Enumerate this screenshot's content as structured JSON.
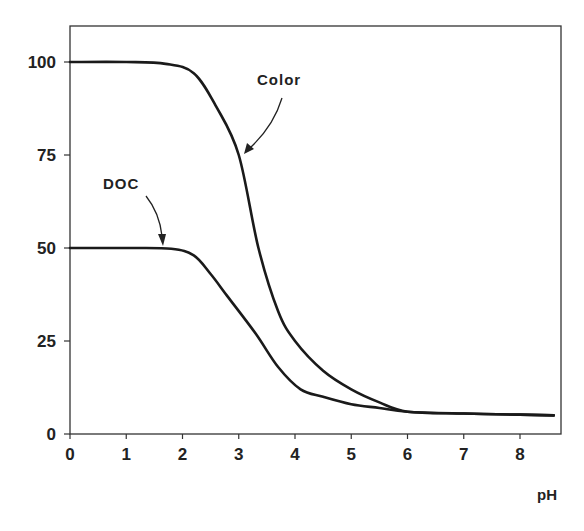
{
  "chart_data": {
    "type": "line",
    "title": "",
    "xlabel": "pH",
    "ylabel": "",
    "xlim": [
      0,
      8.6
    ],
    "ylim": [
      0,
      110
    ],
    "grid": false,
    "legend": null,
    "x_ticks": [
      0,
      1,
      2,
      3,
      4,
      5,
      6,
      7,
      8
    ],
    "y_ticks": [
      0,
      25,
      50,
      75,
      100
    ],
    "series": [
      {
        "name": "Color",
        "x": [
          0,
          1,
          1.7,
          2.2,
          2.6,
          3.0,
          3.35,
          3.7,
          4.0,
          4.5,
          5.0,
          5.5,
          6.0,
          7.0,
          8.0,
          8.6
        ],
        "values": [
          100,
          100,
          99.5,
          97,
          88,
          75,
          50,
          33,
          25,
          17,
          12,
          8.5,
          6,
          5.5,
          5.2,
          5
        ]
      },
      {
        "name": "DOC",
        "x": [
          0,
          1,
          1.8,
          2.2,
          2.5,
          2.8,
          3.3,
          3.7,
          4.1,
          4.5,
          5.0,
          5.5,
          6.0,
          7.0,
          8.0,
          8.6
        ],
        "values": [
          50,
          50,
          49.8,
          48,
          43,
          37,
          27,
          18,
          12,
          10,
          8,
          7,
          6,
          5.5,
          5.2,
          5
        ]
      }
    ],
    "annotations": [
      {
        "text": "Color",
        "points_to": {
          "x": 3.05,
          "y": 75
        }
      },
      {
        "text": "DOC",
        "points_to": {
          "x": 1.65,
          "y": 50
        }
      }
    ]
  },
  "labels": {
    "x_axis_title": "pH",
    "x_ticks": [
      "0",
      "1",
      "2",
      "3",
      "4",
      "5",
      "6",
      "7",
      "8"
    ],
    "y_ticks": [
      "0",
      "25",
      "50",
      "75",
      "100"
    ],
    "color_annotation": "Color",
    "doc_annotation": "DOC"
  },
  "style": {
    "line_color": "#1a1a1a",
    "axis_color": "#333333"
  }
}
